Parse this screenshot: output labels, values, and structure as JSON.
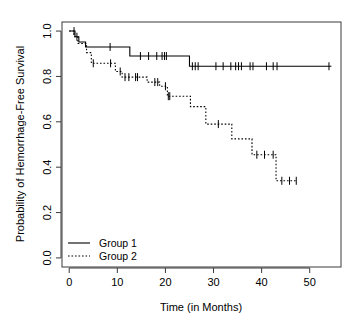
{
  "chart_data": {
    "type": "line",
    "subtype": "kaplan-meier-step",
    "title": "",
    "xlabel": "Time (in Months)",
    "ylabel": "Probability of Hemorrhage-Free Survival",
    "xlim": [
      -1.5,
      56.5
    ],
    "ylim": [
      -0.04,
      1.04
    ],
    "xticks": [
      0,
      10,
      20,
      30,
      40,
      50
    ],
    "xticklabels": [
      "0",
      "10",
      "20",
      "30",
      "40",
      "50"
    ],
    "yticks": [
      0.0,
      0.2,
      0.4,
      0.6,
      0.8,
      1.0
    ],
    "yticklabels": [
      "0.0",
      "0.2",
      "0.4",
      "0.6",
      "0.8",
      "1.0"
    ],
    "grid": false,
    "box": true,
    "legend": {
      "position": "bottom-left",
      "entries": [
        {
          "name": "Group 1",
          "style": "solid"
        },
        {
          "name": "Group 2",
          "style": "dotted"
        }
      ]
    },
    "series": [
      {
        "name": "Group 1",
        "style": "solid",
        "color": "#000000",
        "steps": [
          {
            "t": 0.0,
            "s": 1.0
          },
          {
            "t": 1.2,
            "s": 0.975
          },
          {
            "t": 2.0,
            "s": 0.952
          },
          {
            "t": 3.4,
            "s": 0.93
          },
          {
            "t": 12.6,
            "s": 0.89
          },
          {
            "t": 25.0,
            "s": 0.845
          },
          {
            "t": 54.5,
            "s": 0.845
          }
        ],
        "censored": [
          1.0,
          1.6,
          8.5,
          14.8,
          16.5,
          18.2,
          19.3,
          19.8,
          20.2,
          25.6,
          26.2,
          26.8,
          30.5,
          32.0,
          33.6,
          34.6,
          35.2,
          35.8,
          37.6,
          38.2,
          41.0,
          42.4,
          43.2,
          54.0
        ]
      },
      {
        "name": "Group 2",
        "style": "dotted",
        "color": "#000000",
        "steps": [
          {
            "t": 0.0,
            "s": 1.0
          },
          {
            "t": 1.0,
            "s": 0.975
          },
          {
            "t": 1.8,
            "s": 0.945
          },
          {
            "t": 3.6,
            "s": 0.905
          },
          {
            "t": 4.6,
            "s": 0.858
          },
          {
            "t": 9.6,
            "s": 0.822
          },
          {
            "t": 11.0,
            "s": 0.797
          },
          {
            "t": 16.2,
            "s": 0.775
          },
          {
            "t": 18.8,
            "s": 0.757
          },
          {
            "t": 20.4,
            "s": 0.713
          },
          {
            "t": 25.2,
            "s": 0.667
          },
          {
            "t": 28.4,
            "s": 0.59
          },
          {
            "t": 33.8,
            "s": 0.525
          },
          {
            "t": 38.0,
            "s": 0.455
          },
          {
            "t": 43.0,
            "s": 0.34
          },
          {
            "t": 47.4,
            "s": 0.34
          }
        ],
        "censored": [
          5.0,
          8.6,
          10.6,
          11.6,
          12.4,
          13.8,
          14.2,
          17.8,
          18.4,
          20.0,
          20.6,
          20.9,
          31.0,
          39.0,
          40.6,
          42.4,
          44.2,
          45.8,
          47.2
        ]
      }
    ]
  }
}
